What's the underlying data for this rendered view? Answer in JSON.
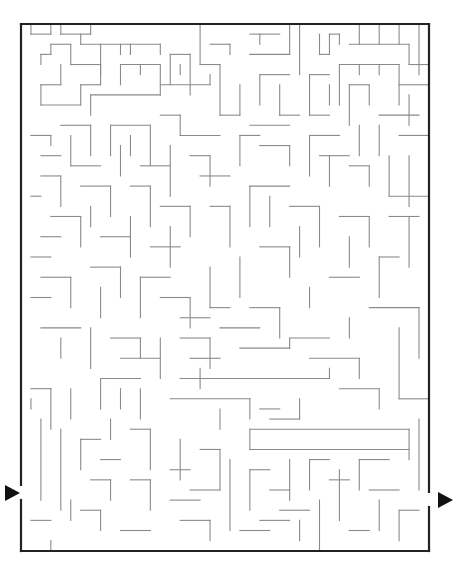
{
  "puzzle": {
    "type": "maze",
    "colors": {
      "background": "#ffffff",
      "border": "#222222",
      "wall": "#8a8a8a",
      "arrow": "#111111"
    },
    "frame": {
      "x": 21,
      "y": 24,
      "width": 408,
      "height": 527,
      "stroke": 2.2
    },
    "grid": {
      "cols": 41,
      "rows": 52,
      "cell_w": 9.95,
      "cell_h": 10.13
    },
    "entrance": {
      "side": "left",
      "gap_y": [
        485,
        500
      ],
      "arrow": {
        "tip_x": 20,
        "y": 493,
        "w": 15,
        "h": 16
      }
    },
    "exit": {
      "side": "right",
      "gap_y": [
        492,
        507
      ],
      "arrow": {
        "base_x": 438,
        "y": 500,
        "w": 15,
        "h": 16
      }
    },
    "walls": [
      [
        1,
        0,
        1,
        1
      ],
      [
        1,
        1,
        3,
        1
      ],
      [
        3,
        1,
        3,
        0
      ],
      [
        4,
        0,
        4,
        1
      ],
      [
        4,
        1,
        7,
        1
      ],
      [
        7,
        1,
        7,
        0
      ],
      [
        6,
        2,
        6,
        1
      ],
      [
        6,
        2,
        14,
        2
      ],
      [
        14,
        2,
        14,
        3
      ],
      [
        10,
        2,
        10,
        3
      ],
      [
        11,
        2,
        11,
        3
      ],
      [
        8,
        2,
        8,
        5
      ],
      [
        2,
        3,
        2,
        4
      ],
      [
        2,
        3,
        3,
        3
      ],
      [
        3,
        3,
        3,
        2
      ],
      [
        3,
        2,
        5,
        2
      ],
      [
        5,
        2,
        5,
        4
      ],
      [
        5,
        4,
        8,
        4
      ],
      [
        4,
        4,
        4,
        6
      ],
      [
        4,
        6,
        2,
        6
      ],
      [
        2,
        6,
        2,
        8
      ],
      [
        2,
        8,
        6,
        8
      ],
      [
        6,
        8,
        6,
        6
      ],
      [
        6,
        6,
        8,
        6
      ],
      [
        8,
        6,
        8,
        4
      ],
      [
        10,
        4,
        14,
        4
      ],
      [
        10,
        4,
        10,
        6
      ],
      [
        12,
        4,
        12,
        5
      ],
      [
        14,
        4,
        14,
        7
      ],
      [
        14,
        7,
        7,
        7
      ],
      [
        7,
        7,
        7,
        9
      ],
      [
        15,
        3,
        15,
        6
      ],
      [
        15,
        3,
        17,
        3
      ],
      [
        17,
        3,
        17,
        7
      ],
      [
        16,
        5,
        16,
        4
      ],
      [
        14,
        6,
        19,
        6
      ],
      [
        19,
        6,
        19,
        5
      ],
      [
        18,
        0,
        18,
        4
      ],
      [
        18,
        4,
        20,
        4
      ],
      [
        20,
        4,
        20,
        9
      ],
      [
        20,
        9,
        22,
        9
      ],
      [
        19,
        2,
        21,
        2
      ],
      [
        21,
        2,
        21,
        3
      ],
      [
        23,
        1,
        26,
        1
      ],
      [
        24,
        1,
        24,
        2
      ],
      [
        23,
        3,
        27,
        3
      ],
      [
        27,
        3,
        27,
        0
      ],
      [
        28,
        0,
        28,
        5
      ],
      [
        30,
        1,
        30,
        3
      ],
      [
        30,
        3,
        31,
        3
      ],
      [
        31,
        3,
        31,
        1
      ],
      [
        31,
        1,
        32,
        1
      ],
      [
        32,
        1,
        32,
        2
      ],
      [
        33,
        2,
        39,
        2
      ],
      [
        34,
        0,
        34,
        2
      ],
      [
        36,
        0,
        36,
        2
      ],
      [
        38,
        0,
        38,
        2
      ],
      [
        40,
        0,
        40,
        5
      ],
      [
        39,
        2,
        39,
        4
      ],
      [
        39,
        4,
        41,
        4
      ],
      [
        32,
        4,
        38,
        4
      ],
      [
        32,
        4,
        32,
        8
      ],
      [
        34,
        4,
        34,
        5
      ],
      [
        36,
        4,
        36,
        5
      ],
      [
        38,
        4,
        38,
        8
      ],
      [
        38,
        6,
        41,
        6
      ],
      [
        29,
        5,
        31,
        5
      ],
      [
        29,
        5,
        29,
        9
      ],
      [
        29,
        9,
        31,
        9
      ],
      [
        31,
        6,
        31,
        8
      ],
      [
        33,
        6,
        35,
        6
      ],
      [
        35,
        6,
        35,
        8
      ],
      [
        33,
        6,
        33,
        10
      ],
      [
        24,
        5,
        27,
        5
      ],
      [
        24,
        5,
        24,
        8
      ],
      [
        26,
        6,
        26,
        9
      ],
      [
        26,
        9,
        28,
        9
      ],
      [
        22,
        6,
        22,
        9
      ],
      [
        23,
        10,
        27,
        10
      ],
      [
        39,
        7,
        39,
        10
      ],
      [
        36,
        9,
        40,
        9
      ],
      [
        34,
        10,
        34,
        13
      ],
      [
        36,
        10,
        36,
        13
      ],
      [
        38,
        11,
        41,
        11
      ],
      [
        22,
        11,
        22,
        14
      ],
      [
        22,
        11,
        24,
        11
      ],
      [
        24,
        12,
        27,
        12
      ],
      [
        27,
        12,
        27,
        14
      ],
      [
        29,
        11,
        29,
        15
      ],
      [
        29,
        11,
        32,
        11
      ],
      [
        30,
        13,
        33,
        13
      ],
      [
        31,
        13,
        31,
        16
      ],
      [
        33,
        14,
        35,
        14
      ],
      [
        35,
        14,
        35,
        16
      ],
      [
        37,
        13,
        37,
        17
      ],
      [
        39,
        13,
        39,
        18
      ],
      [
        37,
        17,
        41,
        17
      ],
      [
        1,
        11,
        3,
        11
      ],
      [
        3,
        11,
        3,
        12
      ],
      [
        2,
        13,
        4,
        13
      ],
      [
        4,
        10,
        7,
        10
      ],
      [
        7,
        10,
        7,
        13
      ],
      [
        5,
        11,
        5,
        14
      ],
      [
        5,
        14,
        8,
        14
      ],
      [
        9,
        10,
        13,
        10
      ],
      [
        9,
        10,
        9,
        13
      ],
      [
        13,
        10,
        13,
        14
      ],
      [
        11,
        11,
        11,
        13
      ],
      [
        14,
        9,
        16,
        9
      ],
      [
        16,
        9,
        16,
        11
      ],
      [
        16,
        11,
        20,
        11
      ],
      [
        10,
        12,
        10,
        15
      ],
      [
        12,
        14,
        15,
        14
      ],
      [
        15,
        12,
        15,
        17
      ],
      [
        17,
        13,
        19,
        13
      ],
      [
        19,
        13,
        19,
        16
      ],
      [
        18,
        15,
        21,
        15
      ],
      [
        2,
        15,
        4,
        15
      ],
      [
        4,
        15,
        4,
        18
      ],
      [
        1,
        17,
        2,
        17
      ],
      [
        6,
        16,
        9,
        16
      ],
      [
        9,
        16,
        9,
        19
      ],
      [
        7,
        18,
        7,
        20
      ],
      [
        11,
        16,
        13,
        16
      ],
      [
        13,
        16,
        13,
        20
      ],
      [
        3,
        19,
        6,
        19
      ],
      [
        6,
        19,
        6,
        22
      ],
      [
        2,
        21,
        4,
        21
      ],
      [
        1,
        23,
        3,
        23
      ],
      [
        8,
        21,
        11,
        21
      ],
      [
        11,
        19,
        11,
        23
      ],
      [
        14,
        18,
        17,
        18
      ],
      [
        17,
        18,
        17,
        21
      ],
      [
        15,
        20,
        15,
        24
      ],
      [
        13,
        22,
        16,
        22
      ],
      [
        19,
        18,
        21,
        18
      ],
      [
        21,
        18,
        21,
        22
      ],
      [
        23,
        16,
        27,
        16
      ],
      [
        23,
        16,
        23,
        20
      ],
      [
        25,
        17,
        25,
        20
      ],
      [
        27,
        18,
        30,
        18
      ],
      [
        30,
        18,
        30,
        22
      ],
      [
        28,
        20,
        28,
        23
      ],
      [
        32,
        19,
        35,
        19
      ],
      [
        35,
        19,
        35,
        22
      ],
      [
        33,
        21,
        33,
        24
      ],
      [
        37,
        19,
        40,
        19
      ],
      [
        39,
        19,
        39,
        24
      ],
      [
        24,
        22,
        27,
        22
      ],
      [
        27,
        22,
        27,
        25
      ],
      [
        22,
        23,
        22,
        27
      ],
      [
        36,
        23,
        38,
        23
      ],
      [
        36,
        23,
        36,
        27
      ],
      [
        31,
        25,
        34,
        25
      ],
      [
        29,
        26,
        29,
        28
      ],
      [
        2,
        25,
        5,
        25
      ],
      [
        5,
        25,
        5,
        28
      ],
      [
        1,
        27,
        3,
        27
      ],
      [
        7,
        24,
        10,
        24
      ],
      [
        10,
        24,
        10,
        27
      ],
      [
        8,
        26,
        8,
        29
      ],
      [
        12,
        25,
        15,
        25
      ],
      [
        12,
        25,
        12,
        29
      ],
      [
        14,
        27,
        17,
        27
      ],
      [
        17,
        27,
        17,
        30
      ],
      [
        19,
        24,
        19,
        28
      ],
      [
        19,
        28,
        21,
        28
      ],
      [
        16,
        29,
        19,
        29
      ],
      [
        23,
        28,
        26,
        28
      ],
      [
        26,
        28,
        26,
        31
      ],
      [
        2,
        30,
        6,
        30
      ],
      [
        4,
        31,
        4,
        33
      ],
      [
        7,
        30,
        7,
        34
      ],
      [
        9,
        31,
        12,
        31
      ],
      [
        12,
        31,
        12,
        33
      ],
      [
        14,
        31,
        14,
        35
      ],
      [
        10,
        33,
        14,
        33
      ],
      [
        16,
        31,
        19,
        31
      ],
      [
        19,
        31,
        19,
        34
      ],
      [
        20,
        30,
        24,
        30
      ],
      [
        22,
        32,
        27,
        32
      ],
      [
        27,
        32,
        27,
        31
      ],
      [
        27,
        31,
        31,
        31
      ],
      [
        17,
        33,
        20,
        33
      ],
      [
        29,
        33,
        34,
        33
      ],
      [
        34,
        33,
        34,
        35
      ],
      [
        16,
        35,
        31,
        35
      ],
      [
        31,
        35,
        31,
        34
      ],
      [
        18,
        34,
        18,
        36
      ],
      [
        32,
        36,
        36,
        36
      ],
      [
        36,
        36,
        36,
        38
      ],
      [
        38,
        30,
        38,
        37
      ],
      [
        38,
        37,
        41,
        37
      ],
      [
        35,
        28,
        40,
        28
      ],
      [
        40,
        28,
        40,
        33
      ],
      [
        33,
        29,
        33,
        31
      ],
      [
        8,
        35,
        12,
        35
      ],
      [
        8,
        35,
        8,
        38
      ],
      [
        10,
        36,
        10,
        38
      ],
      [
        12,
        36,
        12,
        39
      ],
      [
        1,
        36,
        3,
        36
      ],
      [
        3,
        36,
        3,
        40
      ],
      [
        5,
        36,
        5,
        39
      ],
      [
        15,
        37,
        23,
        37
      ],
      [
        23,
        37,
        23,
        39
      ],
      [
        20,
        38,
        20,
        40
      ],
      [
        24,
        38,
        26,
        38
      ],
      [
        25,
        39,
        28,
        39
      ],
      [
        28,
        39,
        28,
        37
      ],
      [
        23,
        40,
        39,
        40
      ],
      [
        23,
        40,
        23,
        42
      ],
      [
        23,
        42,
        39,
        42
      ],
      [
        39,
        40,
        39,
        43
      ],
      [
        40,
        39,
        40,
        46
      ],
      [
        2,
        39,
        2,
        47
      ],
      [
        1,
        37,
        1,
        38
      ],
      [
        4,
        40,
        4,
        48
      ],
      [
        6,
        41,
        8,
        41
      ],
      [
        6,
        41,
        6,
        44
      ],
      [
        8,
        43,
        10,
        43
      ],
      [
        9,
        39,
        9,
        41
      ],
      [
        11,
        40,
        13,
        40
      ],
      [
        13,
        40,
        13,
        44
      ],
      [
        7,
        45,
        9,
        45
      ],
      [
        9,
        45,
        9,
        47
      ],
      [
        5,
        47,
        5,
        49
      ],
      [
        6,
        48,
        8,
        48
      ],
      [
        8,
        48,
        8,
        50
      ],
      [
        11,
        45,
        13,
        45
      ],
      [
        13,
        45,
        13,
        48
      ],
      [
        15,
        44,
        17,
        44
      ],
      [
        16,
        41,
        16,
        45
      ],
      [
        18,
        42,
        20,
        42
      ],
      [
        20,
        42,
        20,
        46
      ],
      [
        17,
        46,
        20,
        46
      ],
      [
        15,
        47,
        18,
        47
      ],
      [
        21,
        43,
        21,
        50
      ],
      [
        23,
        44,
        25,
        44
      ],
      [
        23,
        44,
        23,
        48
      ],
      [
        25,
        46,
        27,
        46
      ],
      [
        27,
        43,
        27,
        47
      ],
      [
        29,
        43,
        31,
        43
      ],
      [
        29,
        43,
        29,
        46
      ],
      [
        31,
        45,
        33,
        45
      ],
      [
        32,
        44,
        32,
        49
      ],
      [
        34,
        43,
        37,
        43
      ],
      [
        34,
        43,
        34,
        46
      ],
      [
        35,
        46,
        38,
        46
      ],
      [
        36,
        47,
        36,
        50
      ],
      [
        38,
        48,
        40,
        48
      ],
      [
        38,
        48,
        38,
        51
      ],
      [
        26,
        48,
        29,
        48
      ],
      [
        28,
        49,
        28,
        51
      ],
      [
        30,
        47,
        30,
        52
      ],
      [
        24,
        49,
        27,
        49
      ],
      [
        22,
        50,
        25,
        50
      ],
      [
        33,
        50,
        35,
        50
      ],
      [
        3,
        51,
        3,
        52
      ],
      [
        1,
        49,
        3,
        49
      ],
      [
        10,
        50,
        13,
        50
      ],
      [
        16,
        49,
        19,
        49
      ],
      [
        19,
        49,
        19,
        51
      ]
    ]
  }
}
